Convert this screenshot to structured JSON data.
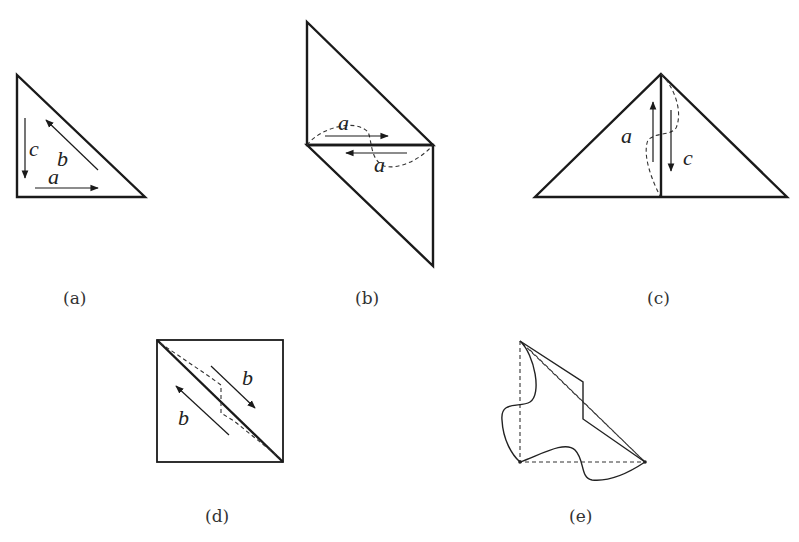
{
  "figure": {
    "panels": [
      {
        "id": "a",
        "caption": "(a)",
        "shape": "right-triangle",
        "edge_labels": [
          "c",
          "b",
          "a"
        ],
        "arrows": [
          {
            "label": "c",
            "direction": "down"
          },
          {
            "label": "b",
            "direction": "up-left"
          },
          {
            "label": "a",
            "direction": "right"
          }
        ]
      },
      {
        "id": "b",
        "caption": "(b)",
        "shape": "parallelogram-two-triangles",
        "edge_labels": [
          "a",
          "a"
        ],
        "arrows": [
          {
            "label": "a",
            "direction": "right"
          },
          {
            "label": "a",
            "direction": "left"
          }
        ]
      },
      {
        "id": "c",
        "caption": "(c)",
        "shape": "isosceles-triangle-split",
        "edge_labels": [
          "a",
          "c"
        ],
        "arrows": [
          {
            "label": "a",
            "direction": "up"
          },
          {
            "label": "c",
            "direction": "down"
          }
        ]
      },
      {
        "id": "d",
        "caption": "(d)",
        "shape": "square-with-diagonal",
        "edge_labels": [
          "b",
          "b"
        ],
        "arrows": [
          {
            "label": "b",
            "direction": "down-right"
          },
          {
            "label": "b",
            "direction": "up-left"
          }
        ]
      },
      {
        "id": "e",
        "caption": "(e)",
        "shape": "deformed-tile",
        "edge_labels": [],
        "arrows": []
      }
    ]
  }
}
